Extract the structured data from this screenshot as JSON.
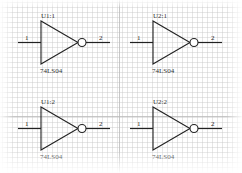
{
  "schematic": {
    "colors": {
      "wire": "#222222",
      "grid": "#c8c8c8",
      "major_grid": "#b4b4b4",
      "background": "#ffffff"
    },
    "gates": [
      {
        "ref": "U1:1",
        "part": "74LS04",
        "pin_in": "1",
        "pin_out": "2",
        "type": "inverter"
      },
      {
        "ref": "U2:1",
        "part": "74LS04",
        "pin_in": "1",
        "pin_out": "2",
        "type": "inverter"
      },
      {
        "ref": "U1:2",
        "part": "74LS04",
        "pin_in": "1",
        "pin_out": "2",
        "type": "inverter"
      },
      {
        "ref": "U2:2",
        "part": "74LS04",
        "pin_in": "1",
        "pin_out": "2",
        "type": "inverter"
      }
    ]
  }
}
